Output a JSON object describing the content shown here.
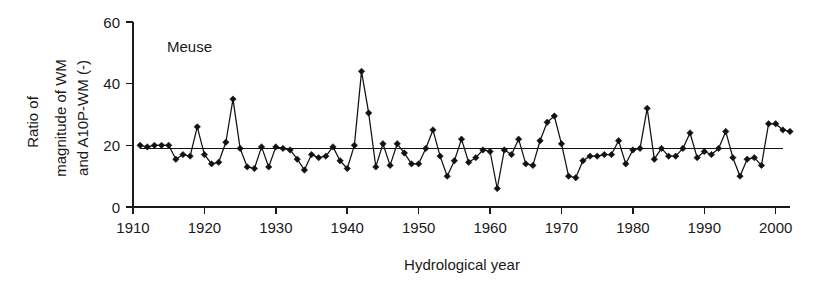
{
  "chart_data": {
    "type": "line",
    "title": "",
    "annotation": "Meuse",
    "xlabel": "Hydrological year",
    "ylabel": "Ratio of magnitude of WM and A10P-WM (-)",
    "ylabel_lines": [
      "Ratio of",
      "magnitude of WM",
      "and A10P-WM (-)"
    ],
    "xlim": [
      1910,
      2002
    ],
    "ylim": [
      0,
      60
    ],
    "xticks": [
      1910,
      1920,
      1930,
      1940,
      1950,
      1960,
      1970,
      1980,
      1990,
      2000
    ],
    "yticks": [
      0,
      20,
      40,
      60
    ],
    "xtick_labels": [
      "1910",
      "1920",
      "1930",
      "1940",
      "1950",
      "1960",
      "1970",
      "1980",
      "1990",
      "2000"
    ],
    "ytick_labels": [
      "0",
      "20",
      "40",
      "60"
    ],
    "grid": false,
    "legend": "none",
    "marker": "diamond",
    "series_color": "#111111",
    "reference_line": {
      "label": "mean level",
      "value": 19.0,
      "orientation": "horizontal",
      "x_start": 1911,
      "x_end": 2001
    },
    "x": [
      1911,
      1912,
      1913,
      1914,
      1915,
      1916,
      1917,
      1918,
      1919,
      1920,
      1921,
      1922,
      1923,
      1924,
      1925,
      1926,
      1927,
      1928,
      1929,
      1930,
      1931,
      1932,
      1933,
      1934,
      1935,
      1936,
      1937,
      1938,
      1939,
      1940,
      1941,
      1942,
      1943,
      1944,
      1945,
      1946,
      1947,
      1948,
      1949,
      1950,
      1951,
      1952,
      1953,
      1954,
      1955,
      1956,
      1957,
      1958,
      1959,
      1960,
      1961,
      1962,
      1963,
      1964,
      1965,
      1966,
      1967,
      1968,
      1969,
      1970,
      1971,
      1972,
      1973,
      1974,
      1975,
      1976,
      1977,
      1978,
      1979,
      1980,
      1981,
      1982,
      1983,
      1984,
      1985,
      1986,
      1987,
      1988,
      1989,
      1990,
      1991,
      1992,
      1993,
      1994,
      1995,
      1996,
      1997,
      1998,
      1999,
      2000,
      2001,
      2002
    ],
    "values": [
      20.0,
      19.5,
      20.0,
      20.0,
      20.0,
      15.5,
      17.0,
      16.5,
      26.0,
      17.0,
      14.0,
      14.5,
      21.0,
      35.0,
      19.0,
      13.0,
      12.5,
      19.5,
      13.0,
      19.5,
      19.0,
      18.5,
      15.5,
      12.0,
      17.0,
      16.0,
      16.5,
      19.5,
      15.0,
      12.5,
      20.0,
      44.0,
      30.5,
      13.0,
      20.5,
      13.5,
      20.5,
      17.5,
      14.0,
      14.0,
      19.0,
      25.0,
      16.5,
      10.0,
      15.0,
      22.0,
      14.5,
      16.0,
      18.5,
      18.0,
      6.0,
      18.5,
      17.0,
      22.0,
      14.0,
      13.5,
      21.5,
      27.5,
      29.5,
      20.5,
      10.0,
      9.5,
      15.0,
      16.5,
      16.5,
      17.0,
      17.0,
      21.5,
      14.0,
      18.5,
      19.0,
      32.0,
      15.5,
      19.0,
      16.5,
      16.5,
      19.0,
      24.0,
      16.0,
      18.0,
      17.0,
      19.0,
      24.5,
      16.0,
      10.0,
      15.5,
      16.0,
      13.5,
      27.0,
      27.0,
      25.0,
      24.5
    ]
  },
  "axis": {
    "x_title": "Hydrological year",
    "y_title_line1": "Ratio of",
    "y_title_line2": "magnitude of WM",
    "y_title_line3": "and A10P-WM (-)"
  },
  "annotation": {
    "series_name": "Meuse"
  }
}
